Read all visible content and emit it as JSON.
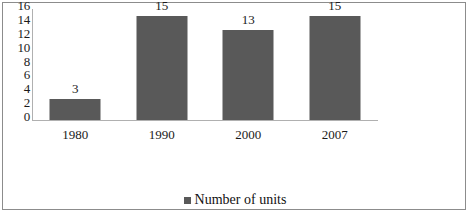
{
  "chart_data": {
    "type": "bar",
    "title": "",
    "subtitle": "",
    "xlabel": "",
    "ylabel": "",
    "categories": [
      "1980",
      "1990",
      "2000",
      "2007"
    ],
    "values": [
      3,
      15,
      13,
      15
    ],
    "value_labels": [
      "3",
      "15",
      "13",
      "15"
    ],
    "series": [
      {
        "name": "Number of units",
        "values": [
          3,
          15,
          13,
          15
        ],
        "color": "#595959"
      }
    ],
    "ylim": [
      0,
      16
    ],
    "yticks": [
      16,
      14,
      12,
      10,
      8,
      6,
      4,
      2,
      0
    ],
    "ytick_labels": [
      "16",
      "14",
      "12",
      "10",
      "8",
      "6",
      "4",
      "2",
      "0"
    ],
    "grid": false,
    "legend": {
      "position": "bottom",
      "entries": [
        {
          "label": "Number of units",
          "color": "#595959",
          "marker": "square"
        }
      ]
    },
    "axis_color": "#b0b0b0",
    "frame_color": "#8c8c8c",
    "text_color": "#1a1a1a",
    "background": "#ffffff"
  }
}
